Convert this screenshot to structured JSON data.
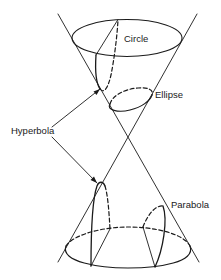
{
  "diagram": {
    "labels": {
      "circle": "Circle",
      "ellipse": "Ellipse",
      "hyperbola": "Hyperbola",
      "parabola": "Parabola"
    },
    "colors": {
      "stroke": "#1a1a1a",
      "background": "#ffffff"
    }
  }
}
